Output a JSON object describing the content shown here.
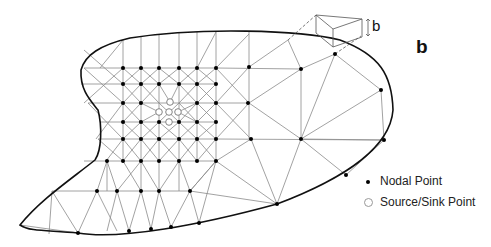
{
  "figure": {
    "panel_label": "b",
    "thickness_label": "b",
    "legend": {
      "items": [
        {
          "symbol": "filled-dot",
          "label": "Nodal Point"
        },
        {
          "symbol": "open-circle",
          "label": "Source/Sink Point"
        }
      ]
    },
    "colors": {
      "boundary": "#111111",
      "mesh": "#8a8a8a",
      "node": "#000000",
      "source": "#ffffff"
    }
  }
}
